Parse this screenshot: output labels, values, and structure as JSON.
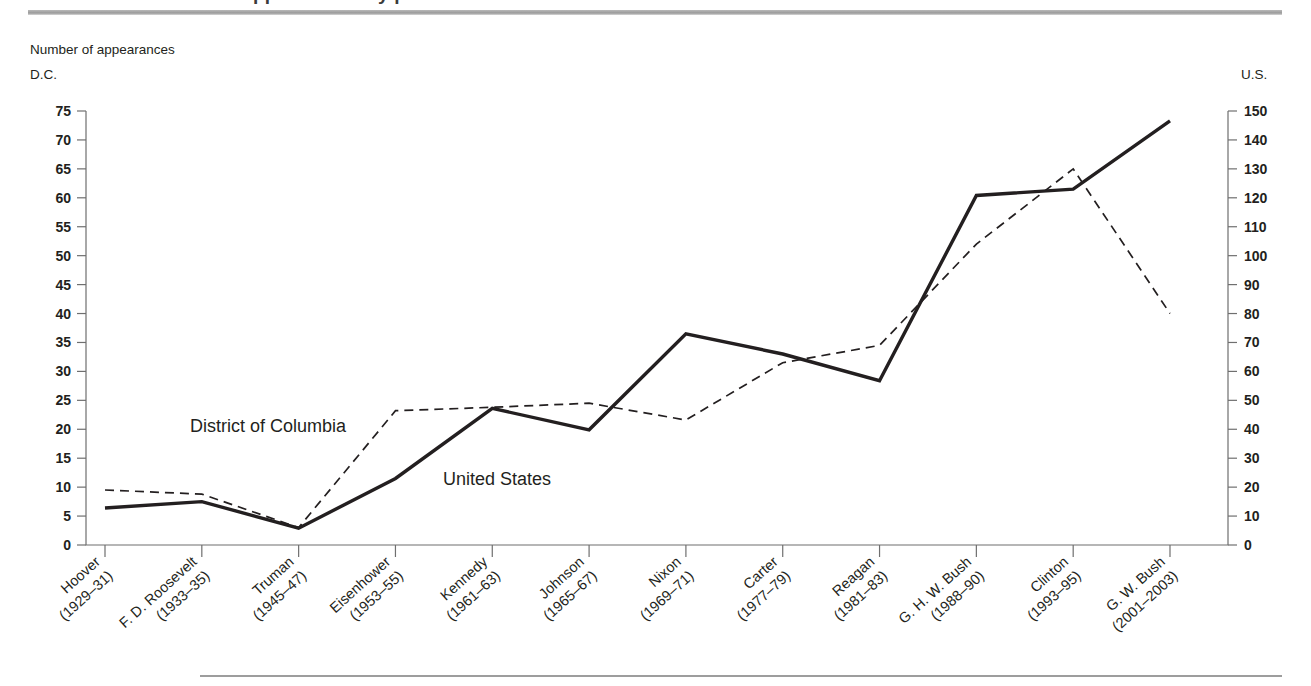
{
  "figure": {
    "title_fragment": "FIGURE 4-1  Number of appearances by presidents",
    "note": "Number of appearances",
    "left_axis_name": "D.C.",
    "right_axis_name": "U.S."
  },
  "chart_data": {
    "type": "line",
    "title": "Number of appearances",
    "xlabel": "",
    "ylabel": "Number of appearances",
    "grid": false,
    "legend_position": "inline-labels",
    "categories": [
      "Hoover\n(1929–31)",
      "F. D. Roosevelt\n(1933–35)",
      "Truman\n(1945–47)",
      "Eisenhower\n(1953–55)",
      "Kennedy\n(1961–63)",
      "Johnson\n(1965–67)",
      "Nixon\n(1969–71)",
      "Carter\n(1977–79)",
      "Reagan\n(1981–83)",
      "G. H. W. Bush\n(1988–90)",
      "Clinton\n(1993–95)",
      "G. W. Bush\n(2001–2003)"
    ],
    "category_names": [
      "Hoover",
      "F. D. Roosevelt",
      "Truman",
      "Eisenhower",
      "Kennedy",
      "Johnson",
      "Nixon",
      "Carter",
      "Reagan",
      "G. H. W. Bush",
      "Clinton",
      "G. W. Bush"
    ],
    "category_years": [
      "(1929–31)",
      "(1933–35)",
      "(1945–47)",
      "(1953–55)",
      "(1961–63)",
      "(1965–67)",
      "(1969–71)",
      "(1977–79)",
      "(1981–83)",
      "(1988–90)",
      "(1993–95)",
      "(2001–2003)"
    ],
    "series": [
      {
        "name": "District of Columbia",
        "axis": "left",
        "style": "dashed",
        "values": [
          9.5,
          8.8,
          3.0,
          23.2,
          23.8,
          24.5,
          21.6,
          31.5,
          34.5,
          52.0,
          65.0,
          40.0
        ]
      },
      {
        "name": "United States",
        "axis": "right",
        "style": "solid",
        "values_left_scale": [
          6.4,
          7.5,
          2.9,
          11.5,
          23.6,
          19.9,
          36.5,
          33.0,
          28.4,
          60.4,
          61.5,
          73.3
        ],
        "values": [
          13,
          15,
          6,
          23,
          47,
          40,
          73,
          66,
          57,
          121,
          123,
          147
        ]
      }
    ],
    "left_axis": {
      "name": "D.C.",
      "min": 0,
      "max": 75,
      "step": 5,
      "ticks": [
        0,
        5,
        10,
        15,
        20,
        25,
        30,
        35,
        40,
        45,
        50,
        55,
        60,
        65,
        70,
        75
      ]
    },
    "right_axis": {
      "name": "U.S.",
      "min": 0,
      "max": 150,
      "step": 10,
      "ticks": [
        0,
        10,
        20,
        30,
        40,
        50,
        60,
        70,
        80,
        90,
        100,
        110,
        120,
        130,
        140,
        150
      ]
    },
    "annotations": [
      {
        "text": "District of Columbia",
        "x": 190,
        "y": 432
      },
      {
        "text": "United States",
        "x": 443,
        "y": 485
      }
    ]
  }
}
